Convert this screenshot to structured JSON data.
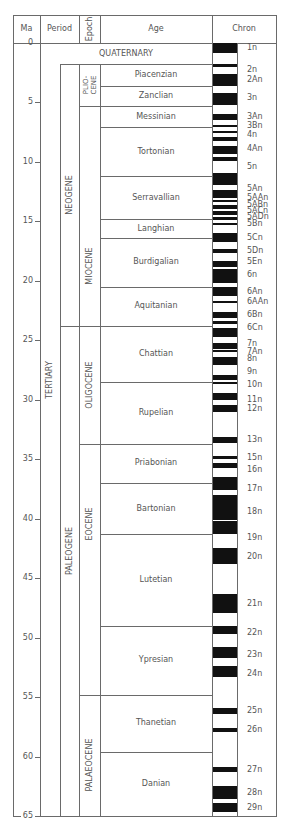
{
  "chart_data": {
    "type": "table",
    "headers": [
      "Ma",
      "Period",
      "Epoch",
      "Age",
      "Chron"
    ],
    "axis": {
      "label": "Ma",
      "ylim": [
        0,
        65
      ],
      "ticks": [
        0,
        5,
        10,
        15,
        20,
        25,
        30,
        35,
        40,
        45,
        50,
        55,
        60,
        65
      ]
    },
    "periods": [
      {
        "name": "QUATERNARY",
        "start": 0,
        "end": 1.8
      },
      {
        "name": "TERTIARY",
        "start": 1.8,
        "end": 65
      }
    ],
    "subperiods": [
      {
        "name": "NEOGENE",
        "start": 1.8,
        "end": 23.8
      },
      {
        "name": "PALEOGENE",
        "start": 23.8,
        "end": 65
      }
    ],
    "epochs": [
      {
        "name": "PLIO-\nCENE",
        "start": 1.8,
        "end": 5.3
      },
      {
        "name": "MIOCENE",
        "start": 5.3,
        "end": 23.8
      },
      {
        "name": "OLIGOCENE",
        "start": 23.8,
        "end": 33.7
      },
      {
        "name": "EOCENE",
        "start": 33.7,
        "end": 54.8
      },
      {
        "name": "PALAEOCENE",
        "start": 54.8,
        "end": 65
      }
    ],
    "ages": [
      {
        "name": "Piacenzian",
        "start": 1.8,
        "end": 3.6
      },
      {
        "name": "Zanclian",
        "start": 3.6,
        "end": 5.3
      },
      {
        "name": "Messinian",
        "start": 5.3,
        "end": 7.1
      },
      {
        "name": "Tortonian",
        "start": 7.1,
        "end": 11.2
      },
      {
        "name": "Serravallian",
        "start": 11.2,
        "end": 14.8
      },
      {
        "name": "Langhian",
        "start": 14.8,
        "end": 16.4
      },
      {
        "name": "Burdigalian",
        "start": 16.4,
        "end": 20.5
      },
      {
        "name": "Aquitanian",
        "start": 20.5,
        "end": 23.8
      },
      {
        "name": "Chattian",
        "start": 23.8,
        "end": 28.5
      },
      {
        "name": "Rupelian",
        "start": 28.5,
        "end": 33.7
      },
      {
        "name": "Priabonian",
        "start": 33.7,
        "end": 37.0
      },
      {
        "name": "Bartonian",
        "start": 37.0,
        "end": 41.3
      },
      {
        "name": "Lutetian",
        "start": 41.3,
        "end": 49.0
      },
      {
        "name": "Ypresian",
        "start": 49.0,
        "end": 54.8
      },
      {
        "name": "Thanetian",
        "start": 54.8,
        "end": 59.6
      },
      {
        "name": "Danian",
        "start": 59.6,
        "end": 65.0
      }
    ],
    "normal_polarity_bands": [
      [
        0.0,
        0.8
      ],
      [
        1.8,
        2.0
      ],
      [
        2.6,
        3.6
      ],
      [
        4.2,
        5.2
      ],
      [
        6.0,
        6.5
      ],
      [
        6.9,
        7.1
      ],
      [
        7.4,
        7.6
      ],
      [
        7.9,
        8.2
      ],
      [
        8.7,
        9.3
      ],
      [
        9.6,
        9.9
      ],
      [
        10.9,
        11.9
      ],
      [
        12.4,
        13.0
      ],
      [
        13.2,
        13.4
      ],
      [
        13.6,
        14.0
      ],
      [
        14.1,
        14.5
      ],
      [
        14.6,
        14.9
      ],
      [
        15.1,
        15.2
      ],
      [
        16.0,
        16.7
      ],
      [
        17.3,
        17.7
      ],
      [
        18.3,
        18.8
      ],
      [
        19.0,
        20.2
      ],
      [
        20.5,
        21.3
      ],
      [
        21.7,
        21.9
      ],
      [
        22.6,
        23.1
      ],
      [
        23.4,
        23.6
      ],
      [
        24.0,
        24.7
      ],
      [
        25.2,
        25.7
      ],
      [
        25.8,
        26.0
      ],
      [
        26.4,
        27.1
      ],
      [
        27.9,
        28.3
      ],
      [
        28.5,
        28.7
      ],
      [
        29.4,
        30.0
      ],
      [
        30.4,
        31.0
      ],
      [
        33.1,
        33.6
      ],
      [
        34.7,
        35.0
      ],
      [
        35.3,
        35.7
      ],
      [
        36.5,
        37.6
      ],
      [
        38.0,
        40.1
      ],
      [
        40.2,
        41.3
      ],
      [
        42.5,
        43.8
      ],
      [
        46.3,
        47.9
      ],
      [
        49.0,
        49.7
      ],
      [
        50.8,
        51.7
      ],
      [
        52.4,
        53.3
      ],
      [
        55.9,
        56.4
      ],
      [
        57.6,
        57.9
      ],
      [
        60.9,
        61.3
      ],
      [
        62.5,
        63.6
      ],
      [
        63.9,
        64.7
      ]
    ],
    "chrons": [
      {
        "label": "1n",
        "ma": 0.4
      },
      {
        "label": "2n",
        "ma": 2.3
      },
      {
        "label": "2An",
        "ma": 3.1
      },
      {
        "label": "3n",
        "ma": 4.6
      },
      {
        "label": "3An",
        "ma": 6.2
      },
      {
        "label": "3Bn",
        "ma": 7.0
      },
      {
        "label": "4n",
        "ma": 7.7
      },
      {
        "label": "4An",
        "ma": 8.9
      },
      {
        "label": "5n",
        "ma": 10.4
      },
      {
        "label": "5An",
        "ma": 12.3
      },
      {
        "label": "5AAn",
        "ma": 13.0
      },
      {
        "label": "5ABn",
        "ma": 13.6
      },
      {
        "label": "5ACn",
        "ma": 14.1
      },
      {
        "label": "5ADn",
        "ma": 14.6
      },
      {
        "label": "5Bn",
        "ma": 15.2
      },
      {
        "label": "5Cn",
        "ma": 16.4
      },
      {
        "label": "5Dn",
        "ma": 17.5
      },
      {
        "label": "5En",
        "ma": 18.4
      },
      {
        "label": "6n",
        "ma": 19.5
      },
      {
        "label": "6An",
        "ma": 20.9
      },
      {
        "label": "6AAn",
        "ma": 21.8
      },
      {
        "label": "6Bn",
        "ma": 22.9
      },
      {
        "label": "6Cn",
        "ma": 24.0
      },
      {
        "label": "7n",
        "ma": 25.3
      },
      {
        "label": "7An",
        "ma": 26.0
      },
      {
        "label": "8n",
        "ma": 26.6
      },
      {
        "label": "9n",
        "ma": 27.7
      },
      {
        "label": "10n",
        "ma": 28.8
      },
      {
        "label": "11n",
        "ma": 30.0
      },
      {
        "label": "12n",
        "ma": 30.8
      },
      {
        "label": "13n",
        "ma": 33.4
      },
      {
        "label": "15n",
        "ma": 34.9
      },
      {
        "label": "16n",
        "ma": 35.9
      },
      {
        "label": "17n",
        "ma": 37.5
      },
      {
        "label": "18n",
        "ma": 39.4
      },
      {
        "label": "19n",
        "ma": 41.6
      },
      {
        "label": "20n",
        "ma": 43.2
      },
      {
        "label": "21n",
        "ma": 47.2
      },
      {
        "label": "22n",
        "ma": 49.6
      },
      {
        "label": "23n",
        "ma": 51.5
      },
      {
        "label": "24n",
        "ma": 53.1
      },
      {
        "label": "25n",
        "ma": 56.2
      },
      {
        "label": "26n",
        "ma": 57.8
      },
      {
        "label": "27n",
        "ma": 61.1
      },
      {
        "label": "28n",
        "ma": 63.1
      },
      {
        "label": "29n",
        "ma": 64.3
      }
    ]
  }
}
